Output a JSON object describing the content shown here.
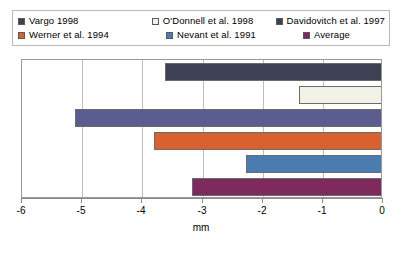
{
  "chart_data": {
    "type": "bar",
    "orientation": "horizontal",
    "title": "",
    "xlabel": "mm",
    "ylabel": "",
    "xlim": [
      -6,
      0
    ],
    "xticks": [
      -6,
      -5,
      -4,
      -3,
      -2,
      -1,
      0
    ],
    "xtick_labels": [
      "-6",
      "-5",
      "-4",
      "-3",
      "-2",
      "-1",
      "0"
    ],
    "grid": true,
    "grid_axis": "x",
    "legend_position": "top",
    "categories": [
      "Vargo 1998",
      "O'Donnell et al. 1998",
      "Davidovitch et al. 1997",
      "Werner et al. 1994",
      "Nevant et al. 1991",
      "Average"
    ],
    "values": [
      -3.63,
      -1.39,
      -5.12,
      -3.8,
      -2.27,
      -3.18
    ],
    "colors": [
      "#3e4154",
      "#f2f1e6",
      "#5b5d8e",
      "#d9602f",
      "#4a7cb0",
      "#7e2a5c"
    ],
    "series": [
      {
        "name": "Vargo 1998",
        "value": -3.63,
        "color": "#3e4154"
      },
      {
        "name": "O'Donnell et al. 1998",
        "value": -1.39,
        "color": "#f2f1e6"
      },
      {
        "name": "Davidovitch et al. 1997",
        "value": -5.12,
        "color": "#5b5d8e"
      },
      {
        "name": "Werner et al. 1994",
        "value": -3.8,
        "color": "#d9602f"
      },
      {
        "name": "Nevant et al. 1991",
        "value": -2.27,
        "color": "#4a7cb0"
      },
      {
        "name": "Average",
        "value": -3.18,
        "color": "#7e2a5c"
      }
    ]
  },
  "legend": {
    "rows": [
      [
        {
          "label": "Vargo 1998",
          "color": "#3e4154"
        },
        {
          "label": "O'Donnell et al. 1998",
          "color": "#f2f1e6"
        },
        {
          "label": "Davidovitch et al. 1997",
          "color": "#3e4154"
        }
      ],
      [
        {
          "label": "Werner et al. 1994",
          "color": "#d9602f"
        },
        {
          "label": "Nevant et al. 1991",
          "color": "#4a7cb0"
        },
        {
          "label": "Average",
          "color": "#7e2a5c"
        }
      ]
    ]
  },
  "axis": {
    "label": "mm",
    "ticks": [
      "-6",
      "-5",
      "-4",
      "-3",
      "-2",
      "-1",
      "0"
    ]
  }
}
